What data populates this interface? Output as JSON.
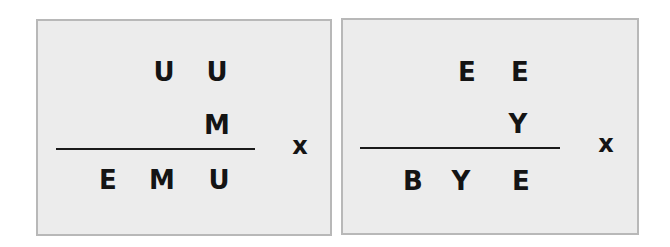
{
  "puzzles": [
    {
      "multiplicand": [
        "U",
        "U"
      ],
      "multiplier": [
        "M"
      ],
      "product": [
        "E",
        "M",
        "U"
      ],
      "operator": "x"
    },
    {
      "multiplicand": [
        "E",
        "E"
      ],
      "multiplier": [
        "Y"
      ],
      "product": [
        "B",
        "Y",
        "E"
      ],
      "operator": "x"
    }
  ]
}
